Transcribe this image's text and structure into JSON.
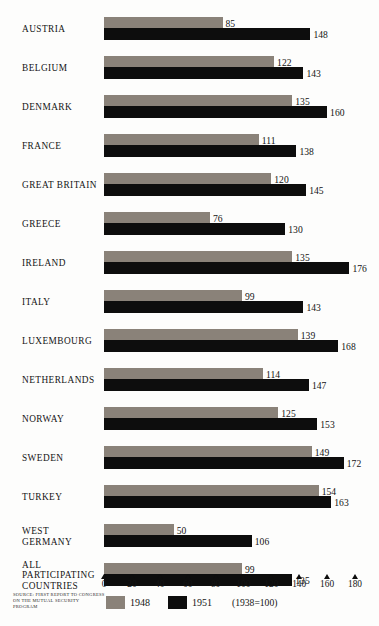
{
  "chart_data": {
    "type": "bar",
    "title": "",
    "orientation": "horizontal",
    "categories": [
      "AUSTRIA",
      "BELGIUM",
      "DENMARK",
      "FRANCE",
      "GREAT BRITAIN",
      "GREECE",
      "IRELAND",
      "ITALY",
      "LUXEMBOURG",
      "NETHERLANDS",
      "NORWAY",
      "SWEDEN",
      "TURKEY",
      "WEST GERMANY",
      "ALL PARTICIPATING COUNTRIES"
    ],
    "category_lines": [
      [
        "AUSTRIA"
      ],
      [
        "BELGIUM"
      ],
      [
        "DENMARK"
      ],
      [
        "FRANCE"
      ],
      [
        "GREAT BRITAIN"
      ],
      [
        "GREECE"
      ],
      [
        "IRELAND"
      ],
      [
        "ITALY"
      ],
      [
        "LUXEMBOURG"
      ],
      [
        "NETHERLANDS"
      ],
      [
        "NORWAY"
      ],
      [
        "SWEDEN"
      ],
      [
        "TURKEY"
      ],
      [
        "WEST",
        "GERMANY"
      ],
      [
        "ALL",
        "PARTICIPATING",
        "COUNTRIES"
      ]
    ],
    "series": [
      {
        "name": "1948",
        "color": "#8a8279",
        "values": [
          85,
          122,
          135,
          111,
          120,
          76,
          135,
          99,
          139,
          114,
          125,
          149,
          154,
          50,
          99
        ]
      },
      {
        "name": "1951",
        "color": "#0d0d0d",
        "values": [
          148,
          143,
          160,
          138,
          145,
          130,
          176,
          143,
          168,
          147,
          153,
          172,
          163,
          106,
          135
        ]
      }
    ],
    "xlabel": "",
    "ylabel": "",
    "xlim": [
      0,
      180
    ],
    "xticks": [
      0,
      20,
      40,
      60,
      80,
      100,
      120,
      140,
      160,
      180
    ],
    "grid": false,
    "legend_position": "bottom-left",
    "base_note": "(1938=100)",
    "source": "SOURCE: FIRST REPORT TO CONGRESS ON THE MUTUAL SECURITY PROGRAM"
  }
}
